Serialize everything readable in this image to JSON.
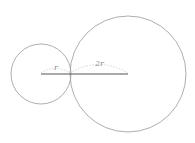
{
  "diagram": {
    "small_circle": {
      "cx": 41,
      "cy": 74,
      "r": 30,
      "color": "#999999"
    },
    "large_circle": {
      "cx": 128,
      "cy": 74,
      "r": 58,
      "color": "#999999"
    },
    "center_line": {
      "x1": 41,
      "x2": 128,
      "y": 74,
      "color": "#555555"
    },
    "labels": {
      "small_radius": "r",
      "large_radius": "2r"
    }
  }
}
